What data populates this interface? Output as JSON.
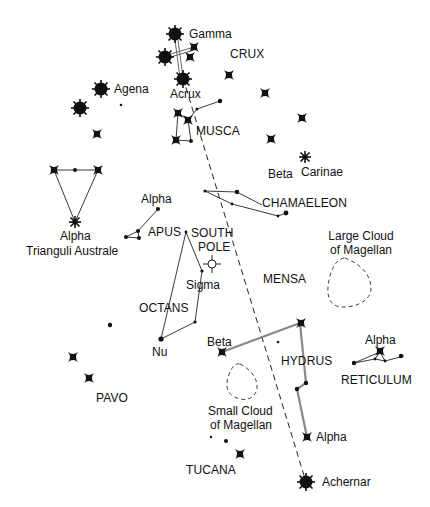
{
  "labels": {
    "gamma": "Gamma",
    "crux": "CRUX",
    "agena": "Agena",
    "acrux": "Acrux",
    "musca": "MUSCA",
    "beta_carinae_1": "Beta",
    "beta_carinae_2": "Carinae",
    "chamaeleon": "CHAMAELEON",
    "apus_alpha": "Alpha",
    "apus": "APUS",
    "south_pole_1": "SOUTH",
    "south_pole_2": "POLE",
    "tri_alpha": "Alpha",
    "tri_name": "Trianguli Australe",
    "lmc_1": "Large Cloud",
    "lmc_2": "of Magellan",
    "mensa": "MENSA",
    "sigma": "Sigma",
    "octans": "OCTANS",
    "nu": "Nu",
    "hydrus_beta": "Beta",
    "hydrus": "HYDRUS",
    "reticulum_alpha": "Alpha",
    "reticulum": "RETICULUM",
    "pavo": "PAVO",
    "smc_1": "Small Cloud",
    "smc_2": "of Magellan",
    "hydrus_alpha": "Alpha",
    "tucana": "TUCANA",
    "achernar": "Achernar"
  },
  "legend_semantics": {
    "large_star": "brightest star (sunburst)",
    "cross_star": "bright star (four-point cross)",
    "dot_star": "faint star (dot)",
    "dashed_line": "pointer line Acrux to Achernar through the South Pole",
    "dashed_outline": "Magellanic Cloud outline"
  },
  "colors": {
    "ink": "#111111",
    "line_gray": "#888888",
    "background": "#ffffff"
  }
}
